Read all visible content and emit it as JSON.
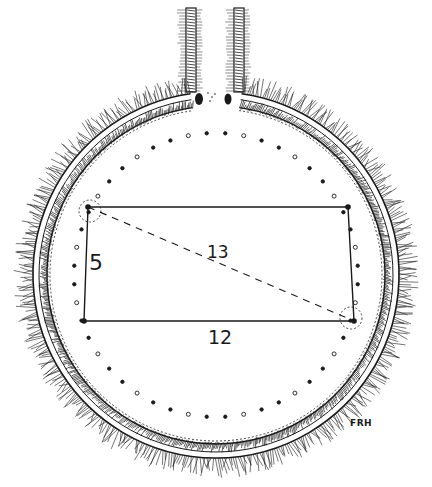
{
  "diagram": {
    "labels": {
      "short_side": "5",
      "diagonal": "13",
      "long_side": "12",
      "signature": "FRH"
    },
    "colors": {
      "ink": "#1a1a1a",
      "background": "#ffffff"
    },
    "geometry": {
      "circle_center": [
        216,
        275
      ],
      "bank_outer_radius": 185,
      "bank_inner_radius": 166,
      "posthole_ring_radius": 142,
      "rectangle": {
        "top_left": [
          88,
          207
        ],
        "top_right": [
          348,
          207
        ],
        "bottom_right": [
          354,
          321
        ],
        "bottom_left": [
          84,
          321
        ]
      },
      "diagonal": {
        "from": [
          88,
          207
        ],
        "to": [
          354,
          321
        ]
      }
    }
  }
}
